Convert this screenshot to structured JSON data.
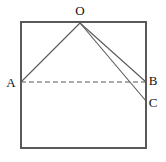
{
  "figure": {
    "background_color": "#ffffff",
    "stroke_color": "#595959",
    "label_color": "#111111",
    "canvas": {
      "width": 166,
      "height": 162
    },
    "rectangle": {
      "name": "outer-rectangle",
      "x": 21,
      "y": 22,
      "width": 125,
      "height": 126,
      "stroke_width": 2
    },
    "points": [
      {
        "id": "O",
        "label": "O",
        "x": 80,
        "y": 23,
        "label_x": 80,
        "label_y": 15
      },
      {
        "id": "A",
        "label": "A",
        "x": 21,
        "y": 82,
        "label_x": 11,
        "label_y": 87
      },
      {
        "id": "B",
        "label": "B",
        "x": 146,
        "y": 82,
        "label_x": 153,
        "label_y": 85
      },
      {
        "id": "C",
        "label": "C",
        "x": 146,
        "y": 101,
        "label_x": 153,
        "label_y": 107
      }
    ],
    "segments": [
      {
        "name": "segment-OA",
        "from": "O",
        "to": "A",
        "style": "solid",
        "x1": 80,
        "y1": 23,
        "x2": 21,
        "y2": 82,
        "stroke_width": 1.1
      },
      {
        "name": "segment-OB",
        "from": "O",
        "to": "B",
        "style": "solid",
        "x1": 80,
        "y1": 23,
        "x2": 146,
        "y2": 82,
        "stroke_width": 1.1
      },
      {
        "name": "segment-OC",
        "from": "O",
        "to": "C",
        "style": "solid",
        "x1": 80,
        "y1": 23,
        "x2": 146,
        "y2": 101,
        "stroke_width": 1.1
      },
      {
        "name": "segment-AB",
        "from": "A",
        "to": "B",
        "style": "dashed",
        "x1": 21,
        "y1": 82,
        "x2": 146,
        "y2": 82,
        "stroke_width": 1.1,
        "dash_pattern": "5,3"
      }
    ]
  }
}
